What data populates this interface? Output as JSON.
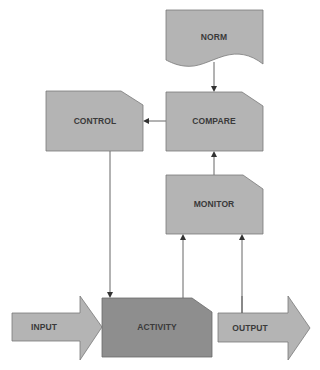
{
  "diagram": {
    "type": "control-loop-flowchart",
    "nodes": {
      "norm": {
        "label": "NORM",
        "shape": "document"
      },
      "compare": {
        "label": "COMPARE",
        "shape": "cut-corner-box"
      },
      "control": {
        "label": "CONTROL",
        "shape": "cut-corner-box"
      },
      "monitor": {
        "label": "MONITOR",
        "shape": "cut-corner-box"
      },
      "activity": {
        "label": "ACTIVITY",
        "shape": "cut-corner-box"
      },
      "input": {
        "label": "INPUT",
        "shape": "block-arrow"
      },
      "output": {
        "label": "OUTPUT",
        "shape": "block-arrow"
      }
    },
    "edges": [
      {
        "from": "NORM",
        "to": "COMPARE"
      },
      {
        "from": "COMPARE",
        "to": "CONTROL"
      },
      {
        "from": "CONTROL",
        "to": "ACTIVITY"
      },
      {
        "from": "MONITOR",
        "to": "COMPARE"
      },
      {
        "from": "ACTIVITY",
        "to": "MONITOR"
      },
      {
        "from": "OUTPUT",
        "to": "MONITOR"
      },
      {
        "from": "INPUT",
        "to": "ACTIVITY"
      },
      {
        "from": "ACTIVITY",
        "to": "OUTPUT"
      }
    ],
    "colors": {
      "box_fill": "#b4b4b4",
      "activity_fill": "#8e8e8e",
      "text": "#3a3a3a"
    }
  }
}
